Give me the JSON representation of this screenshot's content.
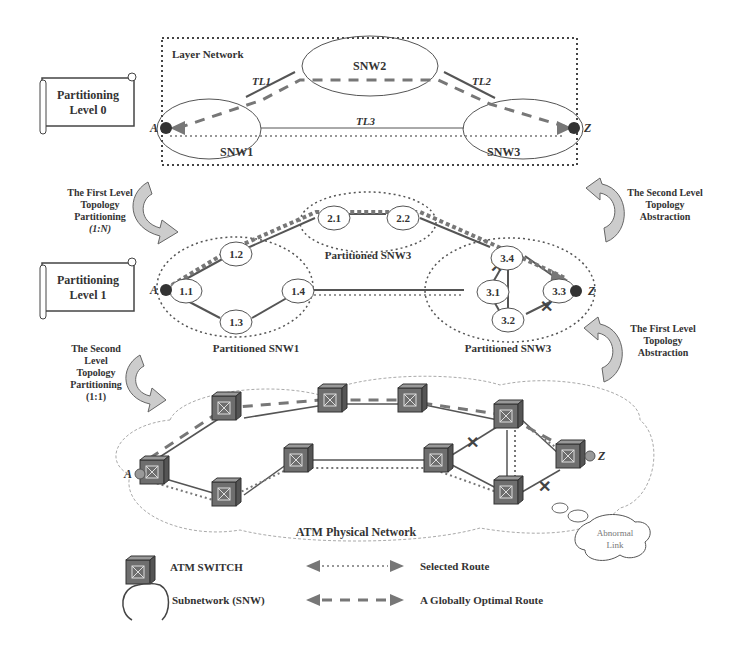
{
  "level0": {
    "box_title": "Layer Network",
    "nodes": {
      "snw1": "SNW1",
      "snw2": "SNW2",
      "snw3": "SNW3"
    },
    "links": {
      "tl1": "TL1",
      "tl2": "TL2",
      "tl3": "TL3"
    },
    "endpoints": {
      "a": "A",
      "z": "Z"
    }
  },
  "level1": {
    "nodes": [
      "1.1",
      "1.2",
      "1.3",
      "1.4",
      "2.1",
      "2.2",
      "3.1",
      "3.2",
      "3.3",
      "3.4"
    ],
    "groups": {
      "snw1": "Partitioned SNW1",
      "snw2": "Partitioned SNW3",
      "snw3": "Partitioned SNW3"
    },
    "endpoints": {
      "a": "A",
      "z": "Z"
    }
  },
  "physical": {
    "title": "ATM Physical Network",
    "endpoints": {
      "a": "A",
      "z": "Z"
    },
    "abnormal_link_line1": "Abnormal",
    "abnormal_link_line2": "Link"
  },
  "scrolls": {
    "level0_line1": "Partitioning",
    "level0_line2": "Level 0",
    "level1_line1": "Partitioning",
    "level1_line2": "Level 1"
  },
  "annotations": {
    "first_partition": [
      "The First Level",
      "Topology",
      "Partitioning",
      "(1:N)"
    ],
    "second_partition": [
      "The Second",
      "Level",
      "Topology",
      "Partitioning",
      "(1:1)"
    ],
    "second_abstraction": [
      "The Second Level",
      "Topology",
      "Abstraction"
    ],
    "first_abstraction": [
      "The First Level",
      "Topology",
      "Abstraction"
    ]
  },
  "legend": {
    "atm_switch": "ATM SWITCH",
    "subnetwork": "Subnetwork (SNW)",
    "selected_route": "Selected Route",
    "optimal_route": "A Globally Optimal Route"
  },
  "colors": {
    "line": "#555555",
    "route": "#777777",
    "switch": "#6e6e6e",
    "text": "#333333"
  }
}
